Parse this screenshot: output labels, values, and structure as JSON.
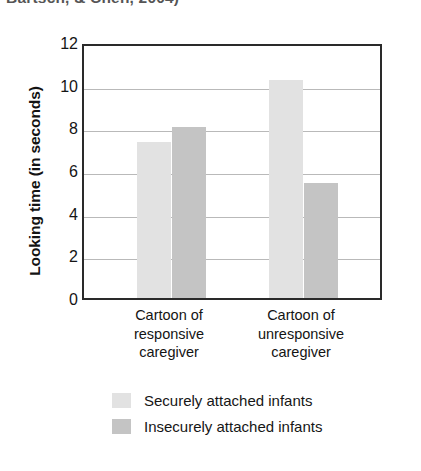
{
  "citation": {
    "text": "Bartsch, & Chen, 2004)"
  },
  "chart_data": {
    "type": "bar",
    "title": "",
    "xlabel": "",
    "ylabel": "Looking time (in seconds)",
    "categories": [
      "Cartoon of responsive caregiver",
      "Cartoon of unresponsive caregiver"
    ],
    "category_lines": [
      [
        "Cartoon of",
        "responsive",
        "caregiver"
      ],
      [
        "Cartoon of",
        "unresponsive",
        "caregiver"
      ]
    ],
    "series": [
      {
        "name": "Securely attached infants",
        "values": [
          7.3,
          10.2
        ],
        "color": "#e2e2e2"
      },
      {
        "name": "Insecurely attached infants",
        "values": [
          8.0,
          5.4
        ],
        "color": "#c4c4c4"
      }
    ],
    "ylim": [
      0,
      12
    ],
    "yticks": [
      0,
      2,
      4,
      6,
      8,
      10,
      12
    ],
    "ytick_labels": [
      "0",
      "2",
      "4",
      "6",
      "8",
      "10",
      "12"
    ],
    "grid": true,
    "grid_axis": "y",
    "legend_position": "below"
  },
  "legend": {
    "entries": [
      {
        "label": "Securely attached infants",
        "swatch": "light"
      },
      {
        "label": "Insecurely attached infants",
        "swatch": "dark"
      }
    ]
  }
}
